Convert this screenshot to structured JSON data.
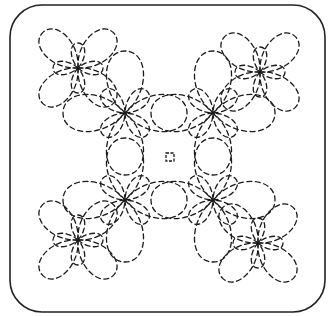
{
  "diagram": {
    "type": "quilting-stitch-pattern",
    "stroke_color": "#1a1a1a",
    "frame_color": "#222222",
    "background": "#ffffff",
    "frame": {
      "x": 10,
      "y": 5,
      "width": 315,
      "height": 307,
      "radius": 32
    },
    "center_square": {
      "cx": 170,
      "cy": 157,
      "size": 8
    },
    "flowers": [
      {
        "name": "top-left-outer",
        "cx": 78,
        "cy": 68,
        "petals": 4,
        "petal_len": 50,
        "petal_width": 20,
        "rotation": 45
      },
      {
        "name": "top-left-inner",
        "cx": 125,
        "cy": 113,
        "petals": 4,
        "petal_len": 62,
        "petal_width": 26,
        "rotation": 0
      },
      {
        "name": "top-right-outer",
        "cx": 260,
        "cy": 72,
        "petals": 4,
        "petal_len": 50,
        "petal_width": 20,
        "rotation": 45
      },
      {
        "name": "top-right-inner",
        "cx": 213,
        "cy": 113,
        "petals": 4,
        "petal_len": 62,
        "petal_width": 26,
        "rotation": 0
      },
      {
        "name": "bottom-left-inner",
        "cx": 125,
        "cy": 200,
        "petals": 4,
        "petal_len": 62,
        "petal_width": 26,
        "rotation": 0
      },
      {
        "name": "bottom-left-outer",
        "cx": 78,
        "cy": 240,
        "petals": 4,
        "petal_len": 50,
        "petal_width": 20,
        "rotation": 45
      },
      {
        "name": "bottom-right-inner",
        "cx": 213,
        "cy": 200,
        "petals": 4,
        "petal_len": 62,
        "petal_width": 26,
        "rotation": 0
      },
      {
        "name": "bottom-right-outer",
        "cx": 258,
        "cy": 243,
        "petals": 4,
        "petal_len": 50,
        "petal_width": 20,
        "rotation": 45
      }
    ]
  }
}
